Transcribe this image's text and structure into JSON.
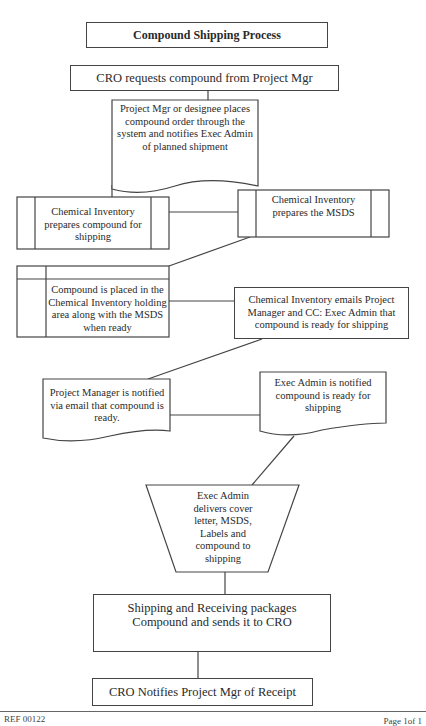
{
  "diagram": {
    "title": "Compound Shipping Process",
    "nodes": {
      "cro_request": "CRO requests compound from Project Mgr",
      "pm_order": "Project Mgr or designee places compound order through the system and notifies Exec Admin of planned shipment",
      "ci_prepares_compound": "Chemical Inventory prepares compound for shipping",
      "ci_prepares_msds": "Chemical Inventory prepares the MSDS",
      "compound_placed": "Compound is placed in the Chemical Inventory holding area along with the MSDS when ready",
      "ci_emails": "Chemical Inventory emails Project Manager and CC: Exec Admin that compound is ready for shipping",
      "pm_notified": "Project Manager is notified via email that compound is ready.",
      "exec_notified": "Exec Admin is notified compound is ready for shipping",
      "exec_delivers": "Exec Admin delivers cover letter, MSDS, Labels and compound to shipping",
      "shipping_packages": "Shipping and Receiving packages Compound and sends it to CRO",
      "cro_notifies": "CRO Notifies Project Mgr of Receipt"
    },
    "shapes": {
      "cro_request": "process",
      "pm_order": "document",
      "ci_prepares_compound": "predefined-process",
      "ci_prepares_msds": "predefined-process",
      "compound_placed": "internal-storage",
      "ci_emails": "process",
      "pm_notified": "document",
      "exec_notified": "document",
      "exec_delivers": "manual-operation",
      "shipping_packages": "process",
      "cro_notifies": "process"
    }
  },
  "footer": {
    "ref": "REF 00122",
    "page": "Page 1of 1"
  }
}
